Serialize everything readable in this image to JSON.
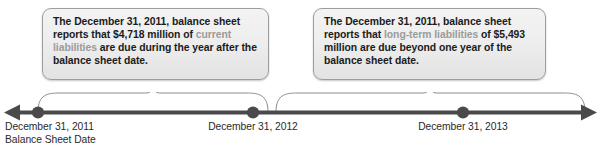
{
  "figure": {
    "type": "timeline-diagram",
    "title": "",
    "axis": {
      "orientation": "horizontal",
      "arrow_left": true,
      "arrow_right": true,
      "color": "#4a4a4a",
      "ticks": [
        {
          "id": "t2011",
          "x": 38,
          "label_line1": "December 31, 2011",
          "label_line2": "Balance Sheet Date"
        },
        {
          "id": "t2012",
          "x": 253,
          "label_line1": "December 31, 2012",
          "label_line2": ""
        },
        {
          "id": "t2013",
          "x": 463,
          "label_line1": "December 31, 2013",
          "label_line2": ""
        }
      ]
    },
    "braces": [
      {
        "id": "brace-current",
        "from_x": 38,
        "to_x": 268,
        "points_to": "callout-left"
      },
      {
        "id": "brace-longterm",
        "from_x": 276,
        "to_x": 585,
        "points_to": "callout-right"
      }
    ]
  },
  "callouts": [
    {
      "id": "current-liabilities",
      "segments": [
        {
          "text": "The December 31, 2011, balance sheet reports that $4,718 million of ",
          "style": "normal"
        },
        {
          "text": "current liabilities",
          "style": "highlight"
        },
        {
          "text": " are due during the year after the balance sheet date.",
          "style": "normal"
        }
      ],
      "prefix": "The December 31, 2011, balance sheet reports that $4,718 million of ",
      "highlight": "current liabilities",
      "suffix": " are due during the year after the balance sheet date.",
      "amount": "$4,718 million",
      "date": "December 31, 2011"
    },
    {
      "id": "long-term-liabilities",
      "prefix": "The December 31, 2011, balance sheet reports that ",
      "highlight": "long-term liabilities",
      "suffix": " of $5,493 million are due beyond one year of the balance sheet date.",
      "amount": "$5,493 million",
      "date": "December 31, 2011"
    }
  ],
  "colors": {
    "text": "#1b1b1b",
    "highlight": "#9b9b9b",
    "axis": "#4a4a4a",
    "brace": "#8e8e8e",
    "box_border": "#9d9d9d",
    "box_fill_top": "#f3f3f3",
    "box_fill_bottom": "#e3e3e3",
    "label": "#2a2a2a"
  }
}
